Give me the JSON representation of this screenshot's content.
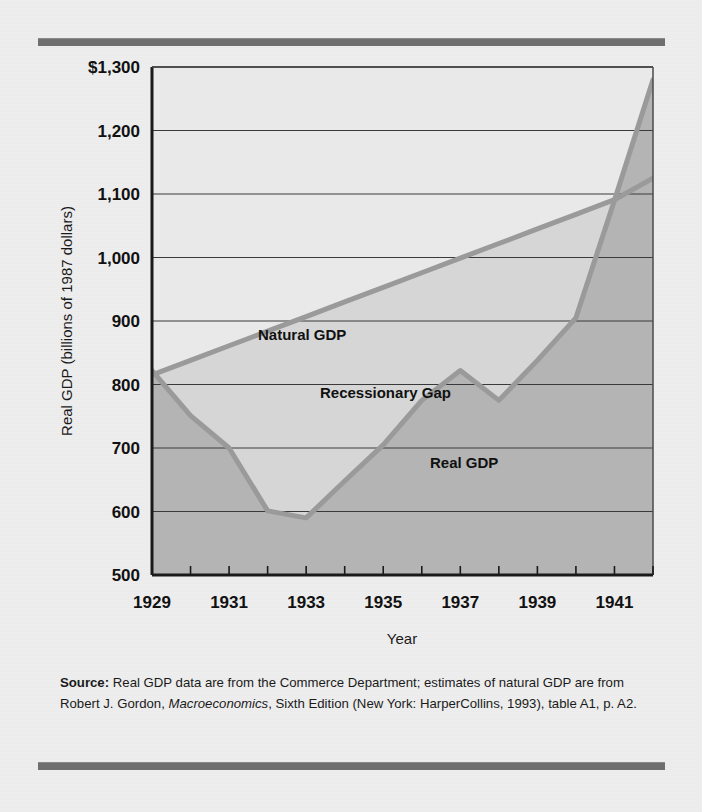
{
  "figure": {
    "background_color": "#eeeeee",
    "rule_color": "#6f6f6f"
  },
  "axes": {
    "y_title": "Real GDP (billions of 1987 dollars)",
    "x_title": "Year",
    "y_ticks": [
      "$1,300",
      "1,200",
      "1,100",
      "1,000",
      "900",
      "800",
      "700",
      "600",
      "500"
    ],
    "x_ticks": [
      "1929",
      "1931",
      "1933",
      "1935",
      "1937",
      "1939",
      "1941"
    ]
  },
  "annotations": {
    "natural_gdp_label": "Natural GDP",
    "recessionary_gap_label": "Recessionary Gap",
    "real_gdp_label": "Real GDP"
  },
  "source": {
    "prefix": "Source:",
    "part1": " Real GDP data are from the Commerce Department; estimates of natural GDP are from Robert J. Gordon, ",
    "italic": "Macroeconomics",
    "part2": ", Sixth Edition (New York: HarperCollins, 1993), table A1, p. A2."
  },
  "chart_data": {
    "type": "line",
    "title": "",
    "xlabel": "Year",
    "ylabel": "Real GDP (billions of 1987 dollars)",
    "xlim": [
      1929,
      1942
    ],
    "ylim": [
      500,
      1300
    ],
    "y_tick_values": [
      500,
      600,
      700,
      800,
      900,
      1000,
      1100,
      1200,
      1300
    ],
    "x_tick_values": [
      1929,
      1931,
      1933,
      1935,
      1937,
      1939,
      1941
    ],
    "grid": "horizontal",
    "legend": "inline-annotations",
    "x": [
      1929,
      1930,
      1931,
      1932,
      1933,
      1934,
      1935,
      1936,
      1937,
      1938,
      1939,
      1940,
      1941,
      1942
    ],
    "series": [
      {
        "name": "Natural GDP",
        "color": "#9a9a9a",
        "values": [
          815,
          838,
          861,
          884,
          907,
          930,
          953,
          976,
          999,
          1022,
          1045,
          1068,
          1091,
          1125
        ]
      },
      {
        "name": "Real GDP",
        "color": "#9a9a9a",
        "values": [
          822,
          751,
          700,
          601,
          590,
          648,
          705,
          775,
          822,
          775,
          838,
          905,
          1090,
          1280
        ]
      }
    ],
    "fills": [
      {
        "name": "Recessionary Gap",
        "between": [
          "Natural GDP",
          "Real GDP"
        ],
        "color": "#d6d6d6"
      },
      {
        "name": "Real GDP area",
        "below": "Real GDP",
        "color": "#b4b4b4"
      }
    ]
  }
}
